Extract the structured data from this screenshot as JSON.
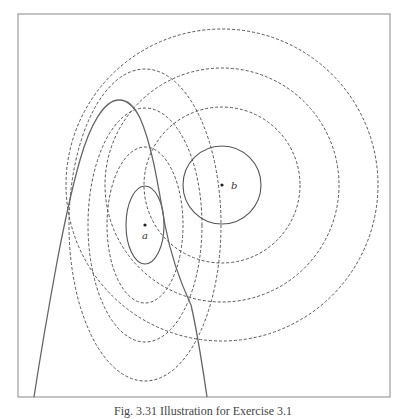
{
  "figure": {
    "caption": "Fig. 3.31 Illustration for Exercise 3.1",
    "top_text_fragment": "",
    "frame": {
      "x": 18,
      "y": 14,
      "width": 372,
      "height": 383,
      "stroke": "#888888"
    },
    "colors": {
      "solid": "#555555",
      "dashed": "#555555",
      "background": "#ffffff"
    },
    "points": [
      {
        "name": "a",
        "label": "a",
        "x": 145,
        "y": 225,
        "label_dx": 0,
        "label_dy": 14
      },
      {
        "name": "b",
        "label": "b",
        "x": 222,
        "y": 185,
        "label_dx": 9,
        "label_dy": 4
      }
    ],
    "solid_ellipse_a": {
      "cx": 145,
      "cy": 225,
      "rx": 19,
      "ry": 39
    },
    "dashed_ellipses_a": [
      {
        "cx": 145,
        "cy": 225,
        "rx": 38,
        "ry": 78
      },
      {
        "cx": 145,
        "cy": 225,
        "rx": 57,
        "ry": 117
      },
      {
        "cx": 145,
        "cy": 225,
        "rx": 76,
        "ry": 156
      }
    ],
    "solid_circle_b": {
      "cx": 222,
      "cy": 185,
      "r": 39
    },
    "dashed_circles_b": [
      {
        "cx": 222,
        "cy": 185,
        "r": 78
      },
      {
        "cx": 222,
        "cy": 185,
        "r": 117
      },
      {
        "cx": 222,
        "cy": 185,
        "r": 156
      }
    ],
    "boundary_curve": "M34,397 C42,345 50,300 57,262 C64,225 70,195 80,160 C90,125 104,100 119,100 C128,100 134,106 140,118 C152,145 158,185 165,225 C172,262 184,290 191,305 C198,335 203,370 207,397"
  }
}
